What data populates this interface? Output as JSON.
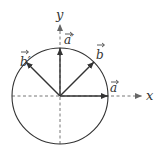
{
  "diagram": {
    "axes": {
      "x_label": "x",
      "y_label": "y"
    },
    "vectors": [
      {
        "id": "a",
        "label": "a",
        "angle_deg": 0
      },
      {
        "id": "b",
        "label": "b",
        "angle_deg": 45
      },
      {
        "id": "a_prime",
        "label": "a′",
        "angle_deg": 90
      },
      {
        "id": "b_prime",
        "label": "b′",
        "angle_deg": 135
      }
    ],
    "circle": {
      "shape": "unit circle"
    },
    "stroke_color": "#333333"
  }
}
